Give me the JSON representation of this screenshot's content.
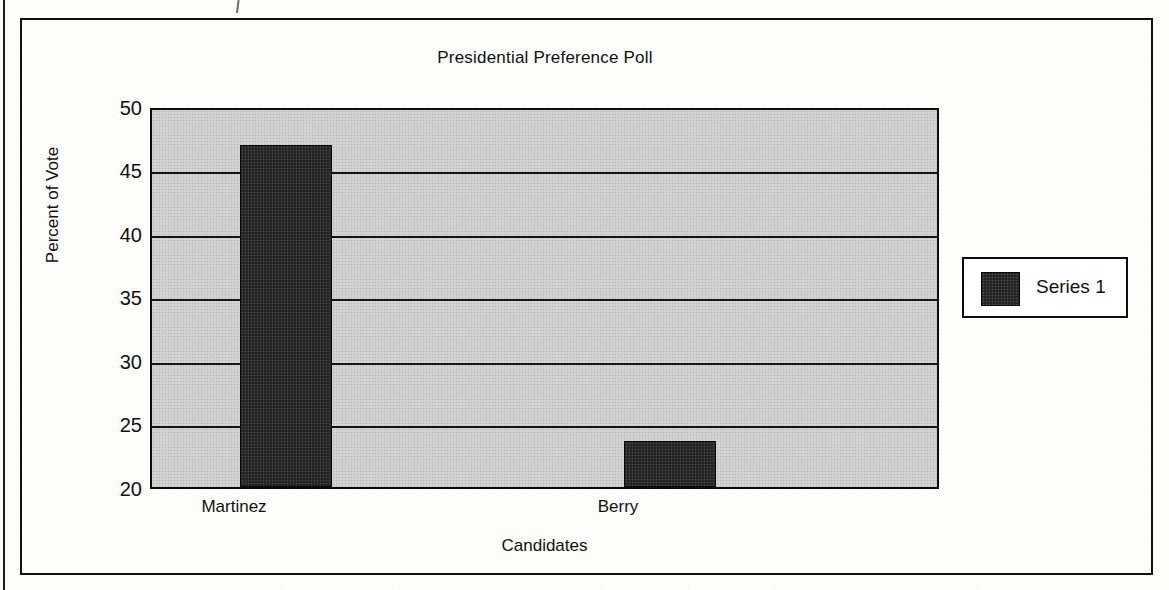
{
  "chart_data": {
    "type": "bar",
    "title": "Presidential Preference Poll",
    "xlabel": "Candidates",
    "ylabel": "Percent of Vote",
    "categories": [
      "Martinez",
      "Berry"
    ],
    "values": [
      47.2,
      23.7
    ],
    "series": [
      {
        "name": "Series 1",
        "values": [
          47.2,
          23.7
        ]
      }
    ],
    "ylim": [
      20,
      50
    ],
    "ytick_labels": [
      "50",
      "45",
      "40",
      "35",
      "30",
      "25",
      "20"
    ],
    "ytick_values": [
      50,
      45,
      40,
      35,
      30,
      25,
      20
    ],
    "grid": true,
    "legend_position": "right",
    "legend_entries": [
      "Series 1"
    ],
    "colors": {
      "bar": "#2b2b2b",
      "plot_background": "#cfcfcf",
      "axis": "#101010",
      "text": "#111111",
      "page_background": "#fdfdfb"
    }
  },
  "legend": {
    "series_1_label": "Series 1"
  }
}
